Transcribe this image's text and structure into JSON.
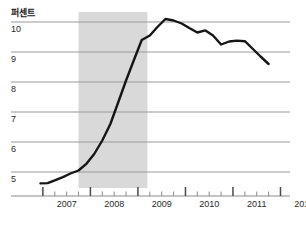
{
  "chart_data": {
    "type": "line",
    "title": "",
    "subtitle": "",
    "ylabel": "퍼센트",
    "xlabel": "",
    "ylim": [
      4.2,
      10.45
    ],
    "xlim": [
      2006.75,
      2012.2
    ],
    "grid": true,
    "gridlines_y": [
      5,
      6,
      7,
      8,
      9,
      10
    ],
    "legend": "none",
    "y_tick_labels": [
      "5",
      "6",
      "7",
      "8",
      "9",
      "10"
    ],
    "x_tick_labels": [
      "2007",
      "2008",
      "2009",
      "2010",
      "2011",
      "2012"
    ],
    "x_major_ticks": [
      2007,
      2008,
      2009,
      2010,
      2011,
      2012
    ],
    "x_minor_ticks_per_year": 4,
    "line_color": "#161616",
    "grid_color": "#9a9a9a",
    "axis_color": "#8c8c8c",
    "shaded_band": {
      "label": "recession",
      "color": "#d9d9d9",
      "x_start": 2007.75,
      "x_end": 2009.2
    },
    "x": [
      2006.95,
      2007.1,
      2007.25,
      2007.42,
      2007.58,
      2007.75,
      2007.92,
      2008.08,
      2008.25,
      2008.42,
      2008.58,
      2008.75,
      2008.92,
      2009.08,
      2009.25,
      2009.42,
      2009.58,
      2009.75,
      2009.92,
      2010.08,
      2010.25,
      2010.42,
      2010.58,
      2010.75,
      2010.92,
      2011.08,
      2011.25,
      2011.42,
      2011.58,
      2011.75
    ],
    "values": [
      4.62,
      4.63,
      4.72,
      4.83,
      4.95,
      5.05,
      5.28,
      5.6,
      6.05,
      6.6,
      7.3,
      8.05,
      8.75,
      9.4,
      9.55,
      9.85,
      10.1,
      10.05,
      9.95,
      9.8,
      9.65,
      9.72,
      9.55,
      9.25,
      9.35,
      9.38,
      9.36,
      9.1,
      8.85,
      8.6
    ],
    "series": [
      {
        "name": "percent",
        "values": [
          4.62,
          4.63,
          4.72,
          4.83,
          4.95,
          5.05,
          5.28,
          5.6,
          6.05,
          6.6,
          7.3,
          8.05,
          8.75,
          9.4,
          9.55,
          9.85,
          10.1,
          10.05,
          9.95,
          9.8,
          9.65,
          9.72,
          9.55,
          9.25,
          9.35,
          9.38,
          9.36,
          9.1,
          8.85,
          8.6
        ]
      }
    ]
  }
}
